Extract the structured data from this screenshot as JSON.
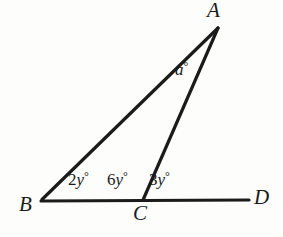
{
  "figure": {
    "type": "plane-geometry-diagram",
    "background_color": "#fdfdfb",
    "stroke_color": "#1b1b1b",
    "canvas": {
      "width": 283,
      "height": 237
    }
  },
  "points": [
    {
      "name": "A",
      "label": "A",
      "x": 218,
      "y": 28
    },
    {
      "name": "B",
      "label": "B",
      "x": 42,
      "y": 201
    },
    {
      "name": "C",
      "label": "C",
      "x": 143,
      "y": 201
    },
    {
      "name": "D",
      "label": "D",
      "x": 249,
      "y": 200
    }
  ],
  "segments": [
    {
      "name": "segment-BD",
      "from": "B",
      "to": "D",
      "x1": 41,
      "y1": 201,
      "x2": 249,
      "y2": 200,
      "width": 3.2
    },
    {
      "name": "segment-BA",
      "from": "B",
      "to": "A",
      "x1": 42,
      "y1": 199,
      "x2": 218,
      "y2": 28,
      "width": 3.2
    },
    {
      "name": "segment-CA",
      "from": "C",
      "to": "A",
      "x1": 143,
      "y1": 200,
      "x2": 218,
      "y2": 28,
      "width": 3.2
    }
  ],
  "angles": [
    {
      "name": "angle-ABC",
      "coefficient": "2",
      "variable": "y",
      "unit": "°",
      "text": "2y°",
      "at_vertex": "B"
    },
    {
      "name": "angle-ACB",
      "coefficient": "6",
      "variable": "y",
      "unit": "°",
      "text": "6y°",
      "at_vertex": "C"
    },
    {
      "name": "angle-ACD",
      "coefficient": "3",
      "variable": "y",
      "unit": "°",
      "text": "3y°",
      "at_vertex": "C"
    },
    {
      "name": "angle-BAC",
      "coefficient": "",
      "variable": "a",
      "unit": "°",
      "text": "a°",
      "at_vertex": "A"
    }
  ],
  "labels": {
    "A": "A",
    "B": "B",
    "C": "C",
    "D": "D",
    "angle_2y": {
      "num": "2",
      "var": "y",
      "deg": "°"
    },
    "angle_6y": {
      "num": "6",
      "var": "y",
      "deg": "°"
    },
    "angle_3y": {
      "num": "3",
      "var": "y",
      "deg": "°"
    },
    "angle_a": {
      "num": "",
      "var": "a",
      "deg": "°"
    }
  }
}
